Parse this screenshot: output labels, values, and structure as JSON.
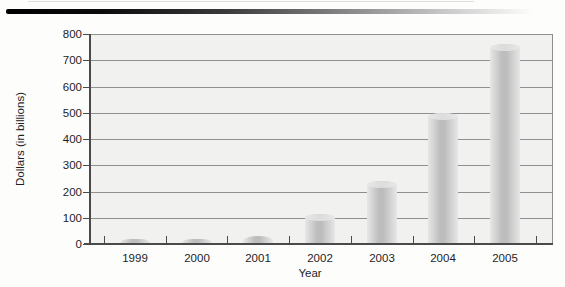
{
  "figure": {
    "background": "#fdfdfc",
    "top_rule": {
      "from_color": "#000000",
      "to_color": "#ffffff"
    }
  },
  "chart_data": {
    "type": "bar",
    "title": "",
    "categories": [
      "1999",
      "2000",
      "2001",
      "2002",
      "2003",
      "2004",
      "2005"
    ],
    "values": [
      20,
      20,
      30,
      115,
      240,
      500,
      760
    ],
    "xlabel": "Year",
    "ylabel": "Dollars (in billions)",
    "ylim": [
      0,
      800
    ],
    "ytick_step": 100,
    "yticks": [
      800,
      700,
      600,
      500,
      400,
      300,
      200,
      100,
      0
    ],
    "grid": true,
    "legend": false,
    "plot_bg": "#f1f1ef",
    "gridline_color": "#8f8f8f",
    "axis_color": "#4a4a4a",
    "text_color": "#1e1e1e",
    "bar_color_center": "#bdbdbd",
    "bar_color_edge": "#e7e7e7",
    "bar_cap_color": "#dcdcdc"
  }
}
